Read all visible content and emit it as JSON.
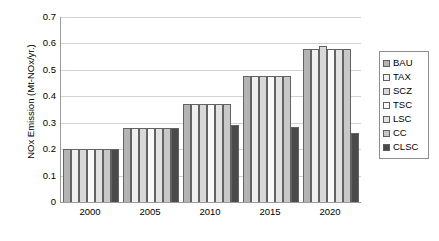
{
  "chart_data": {
    "type": "bar",
    "title": "",
    "xlabel": "",
    "ylabel": "NOx Emission (Mt-NOx/yr.)",
    "categories": [
      "2000",
      "2005",
      "2010",
      "2015",
      "2020"
    ],
    "ylim": [
      0,
      0.7
    ],
    "ytick_labels": [
      "0.7",
      "0.6",
      "0.5",
      "0.4",
      "0.3",
      "0.2",
      "0.1",
      "0"
    ],
    "ytick_values": [
      0.7,
      0.6,
      0.5,
      0.4,
      0.3,
      0.2,
      0.1,
      0
    ],
    "grid": "horizontal",
    "legend_position": "right",
    "series": [
      {
        "name": "BAU",
        "color": "#b4b4b4",
        "values": [
          0.2,
          0.28,
          0.37,
          0.475,
          0.58
        ]
      },
      {
        "name": "TAX",
        "color": "#f0f0f0",
        "values": [
          0.2,
          0.28,
          0.37,
          0.475,
          0.58
        ]
      },
      {
        "name": "SCZ",
        "color": "#d8d8d8",
        "values": [
          0.2,
          0.28,
          0.37,
          0.475,
          0.59
        ]
      },
      {
        "name": "TSC",
        "color": "#fafafa",
        "values": [
          0.2,
          0.28,
          0.37,
          0.475,
          0.58
        ]
      },
      {
        "name": "LSC",
        "color": "#e2e2e2",
        "values": [
          0.2,
          0.28,
          0.37,
          0.475,
          0.58
        ]
      },
      {
        "name": "CC",
        "color": "#c8c8c8",
        "values": [
          0.2,
          0.28,
          0.37,
          0.475,
          0.58
        ]
      },
      {
        "name": "CLSC",
        "color": "#4a4a4a",
        "values": [
          0.2,
          0.28,
          0.293,
          0.283,
          0.262
        ]
      }
    ]
  },
  "legend": {
    "items": [
      {
        "label": "BAU"
      },
      {
        "label": "TAX"
      },
      {
        "label": "SCZ"
      },
      {
        "label": "TSC"
      },
      {
        "label": "LSC"
      },
      {
        "label": "CC"
      },
      {
        "label": "CLSC"
      }
    ]
  }
}
